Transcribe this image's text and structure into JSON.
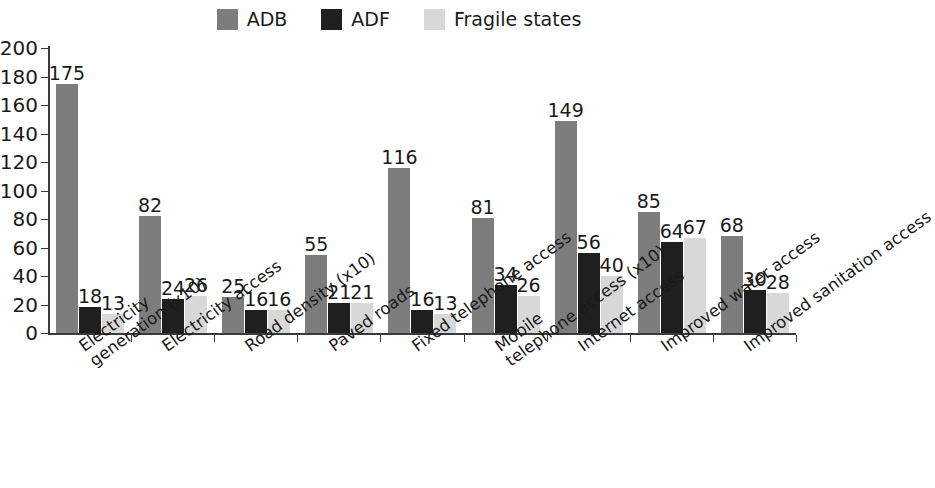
{
  "chart_data": {
    "type": "bar",
    "title": "",
    "subtitle": "",
    "xlabel": "",
    "ylabel": "",
    "ylim": [
      0,
      200
    ],
    "yticks": [
      0,
      20,
      40,
      60,
      80,
      100,
      120,
      140,
      160,
      180,
      200
    ],
    "grid": false,
    "legend_position": "top-center",
    "categories": [
      "Electricity generation (x10)",
      "Electricity access",
      "Road density (x10)",
      "Paved roads",
      "Fixed telephone access",
      "Mobile telephone access (x10)",
      "Internet access",
      "Improved water access",
      "Improved sanitation access"
    ],
    "category_lines": [
      [
        "Electricity",
        "generation (x10)"
      ],
      [
        "Electricity access",
        ""
      ],
      [
        "Road density (x10)",
        ""
      ],
      [
        "Paved roads",
        ""
      ],
      [
        "Fixed telephone access",
        ""
      ],
      [
        "Mobile",
        "telephone access (x10)"
      ],
      [
        "Internet access",
        ""
      ],
      [
        "Improved water access",
        ""
      ],
      [
        "Improved sanitation access",
        ""
      ]
    ],
    "series": [
      {
        "name": "ADB",
        "color": "#7d7d7d",
        "values": [
          175,
          82,
          25,
          55,
          116,
          81,
          149,
          85,
          68
        ]
      },
      {
        "name": "ADF",
        "color": "#1f1f1f",
        "values": [
          18,
          24,
          16,
          21,
          16,
          34,
          56,
          64,
          30
        ]
      },
      {
        "name": "Fragile states",
        "color": "#d8d8d8",
        "values": [
          13,
          26,
          16,
          21,
          13,
          26,
          40,
          67,
          28
        ]
      }
    ]
  }
}
